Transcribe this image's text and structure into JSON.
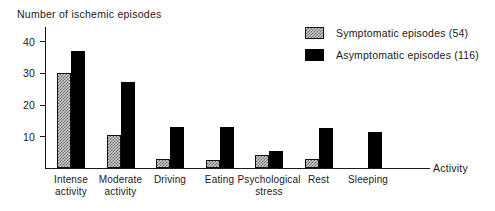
{
  "chart_data": {
    "type": "bar",
    "title": "Number of ischemic episodes",
    "xlabel": "Activity",
    "ylabel": "Number of ischemic episodes",
    "ylim": [
      0,
      43
    ],
    "grid": false,
    "legend_position": "top-right",
    "yticks": [
      10,
      20,
      30,
      40
    ],
    "ytick_labels": [
      "10",
      "20",
      "30",
      "40"
    ],
    "categories": [
      "Intense activity",
      "Moderate activity",
      "Driving",
      "Eating",
      "Psychological stress",
      "Rest",
      "Sleeping"
    ],
    "category_lines": [
      [
        "Intense",
        "activity"
      ],
      [
        "Moderate",
        "activity"
      ],
      [
        "Driving"
      ],
      [
        "Eating"
      ],
      [
        "Psychological",
        "stress"
      ],
      [
        "Rest"
      ],
      [
        "Sleeping"
      ]
    ],
    "series": [
      {
        "name": "Symptomatic episodes",
        "total": 54,
        "legend_label": "Symptomatic episodes  (54)",
        "color": "#c9c9c9",
        "pattern": "checkered",
        "values": [
          30,
          10.5,
          3,
          2.5,
          4,
          3,
          0
        ]
      },
      {
        "name": "Asymptomatic episodes",
        "total": 116,
        "legend_label": "Asymptomatic episodes  (116)",
        "color": "#000000",
        "pattern": "solid",
        "values": [
          37,
          27,
          13,
          13,
          5.5,
          12.5,
          11.5
        ]
      }
    ]
  },
  "axis": {
    "caption": "Activity"
  },
  "legend": {
    "items": [
      {
        "label": "Symptomatic episodes  (54)",
        "swatch": "checkered-swatch"
      },
      {
        "label": "Asymptomatic episodes  (116)",
        "swatch": "solid-black-swatch"
      }
    ]
  }
}
